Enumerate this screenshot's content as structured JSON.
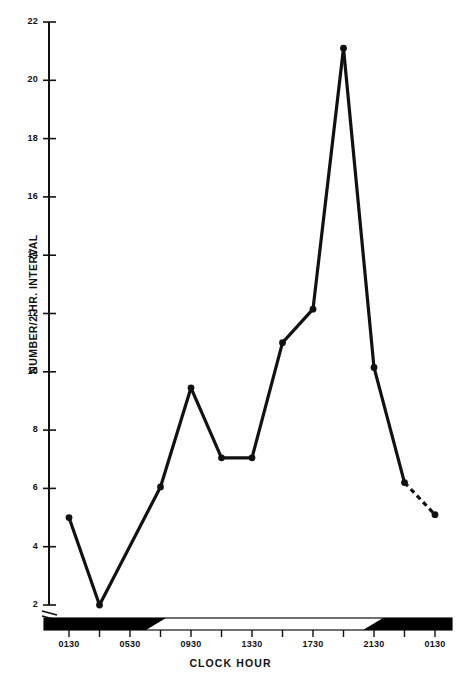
{
  "chart_data": {
    "type": "line",
    "title": "",
    "xlabel": "CLOCK HOUR",
    "ylabel": "NUMBER/2-HR. INTERVAL",
    "ylim": [
      2,
      22
    ],
    "ytick_labels": [
      "22",
      "20",
      "18",
      "16",
      "14",
      "12",
      "10",
      "8",
      "6",
      "4",
      "2"
    ],
    "ytick_values": [
      22,
      20,
      18,
      16,
      14,
      12,
      10,
      8,
      6,
      4,
      2
    ],
    "xtick_labels": [
      "0130",
      "0530",
      "0930",
      "1330",
      "1730",
      "2130",
      "0130"
    ],
    "x": [
      "0130",
      "0330",
      "0530",
      "0730",
      "0930",
      "1130",
      "1330",
      "1530",
      "1730",
      "1930",
      "2130",
      "2330",
      "0130"
    ],
    "values": [
      5.0,
      2.0,
      null,
      6.05,
      9.45,
      7.05,
      7.05,
      11.0,
      12.15,
      21.1,
      10.15,
      6.2,
      5.1
    ],
    "points": [
      {
        "hour": "0130",
        "value": 5.0,
        "marker": true,
        "dashed_to_next": false
      },
      {
        "hour": "0330",
        "value": 2.0,
        "marker": true,
        "dashed_to_next": false
      },
      {
        "hour": "0730",
        "value": 6.05,
        "marker": true,
        "dashed_to_next": false
      },
      {
        "hour": "0930",
        "value": 9.45,
        "marker": true,
        "dashed_to_next": false
      },
      {
        "hour": "1130",
        "value": 7.05,
        "marker": true,
        "dashed_to_next": false
      },
      {
        "hour": "1330",
        "value": 7.05,
        "marker": true,
        "dashed_to_next": false
      },
      {
        "hour": "1530",
        "value": 11.0,
        "marker": true,
        "dashed_to_next": false
      },
      {
        "hour": "1730",
        "value": 12.15,
        "marker": true,
        "dashed_to_next": false
      },
      {
        "hour": "1930",
        "value": 21.1,
        "marker": true,
        "dashed_to_next": false
      },
      {
        "hour": "2130",
        "value": 10.15,
        "marker": true,
        "dashed_to_next": false
      },
      {
        "hour": "2330",
        "value": 6.2,
        "marker": true,
        "dashed_to_next": true
      },
      {
        "hour": "0130",
        "value": 5.1,
        "marker": true,
        "dashed_to_next": false
      }
    ],
    "axis_break": true,
    "grid": false,
    "legend": null,
    "daynight_bar": {
      "dark_segments": [
        [
          "0030",
          "0600"
        ],
        [
          "2200",
          "0200"
        ]
      ],
      "light_segments": [
        [
          "0600",
          "2200"
        ]
      ],
      "dark_color": "#000000",
      "light_color": "#ffffff"
    },
    "line_color": "#111111",
    "marker_color": "#111111"
  },
  "axis": {
    "y_label_text": "NUMBER/2-HR. INTERVAL",
    "x_label_text": "CLOCK HOUR"
  }
}
